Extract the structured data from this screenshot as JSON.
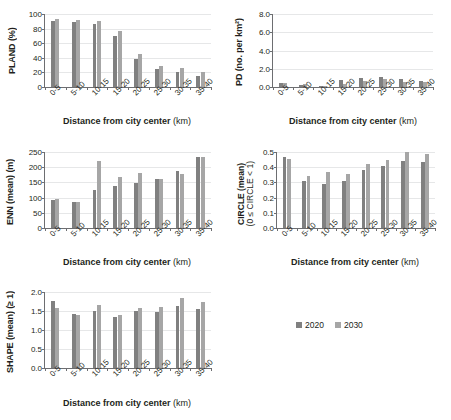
{
  "figure": {
    "legend": {
      "position": "center-right",
      "entries": [
        {
          "label": "2020",
          "color": "#808080"
        },
        {
          "label": "2030",
          "color": "#a6a6a6"
        }
      ]
    },
    "shared_xlabel": "Distance from city center",
    "shared_xunit": "(km)",
    "categories": [
      "0-5",
      "5-10",
      "10-15",
      "15-20",
      "20-25",
      "25-30",
      "30-35",
      "35-40"
    ]
  },
  "chart_data": [
    {
      "id": "pland",
      "type": "bar",
      "title": "",
      "xlabel": "Distance from city center (km)",
      "ylabel": "PLAND (%)",
      "ylabel_main": "PLAND",
      "ylabel_unit": "(%)",
      "categories": [
        "0-5",
        "5-10",
        "10-15",
        "15-20",
        "20-25",
        "25-30",
        "30-35",
        "35-40"
      ],
      "series": [
        {
          "name": "2020",
          "color": "#808080",
          "values": [
            91,
            88.5,
            86.5,
            69.5,
            38,
            24,
            20.5,
            15.5
          ]
        },
        {
          "name": "2030",
          "color": "#a6a6a6",
          "values": [
            93.5,
            91.5,
            90.5,
            76.5,
            45,
            29,
            26,
            20.5
          ]
        }
      ],
      "ylim": [
        0,
        100
      ],
      "yticks": [
        0,
        20,
        40,
        60,
        80,
        100
      ],
      "ytick_labels": [
        "0",
        "20",
        "40",
        "60",
        "80",
        "100"
      ],
      "grid": true
    },
    {
      "id": "pd",
      "type": "bar",
      "title": "",
      "xlabel": "Distance from city center (km)",
      "ylabel": "PD (no. per km²)",
      "ylabel_main": "PD",
      "ylabel_unit": "(no. per km²)",
      "categories": [
        "0-5",
        "5-10",
        "10-15",
        "15-20",
        "20-25",
        "25-30",
        "30-35",
        "35-40"
      ],
      "series": [
        {
          "name": "2020",
          "color": "#808080",
          "values": [
            0.4,
            0.2,
            0.1,
            0.75,
            1.0,
            1.05,
            0.85,
            0.65
          ]
        },
        {
          "name": "2030",
          "color": "#a6a6a6",
          "values": [
            0.4,
            0.3,
            0.1,
            0.3,
            0.7,
            0.85,
            0.6,
            0.5
          ]
        }
      ],
      "ylim": [
        0,
        8
      ],
      "yticks": [
        0,
        2,
        4,
        6,
        8
      ],
      "ytick_labels": [
        "0.0",
        "2.0",
        "4.0",
        "6.0",
        "8.0"
      ],
      "grid": true
    },
    {
      "id": "enn",
      "type": "bar",
      "title": "",
      "xlabel": "Distance from city center (km)",
      "ylabel": "ENN (mean) (m)",
      "ylabel_main": "ENN",
      "ylabel_unit": "(mean) (m)",
      "categories": [
        "0-5",
        "5-10",
        "10-15",
        "15-20",
        "20-25",
        "25-30",
        "30-35",
        "35-40"
      ],
      "series": [
        {
          "name": "2020",
          "color": "#808080",
          "values": [
            91,
            85,
            125,
            138,
            149,
            160,
            188,
            233
          ]
        },
        {
          "name": "2030",
          "color": "#a6a6a6",
          "values": [
            94,
            85,
            222,
            167,
            180,
            162,
            178,
            233
          ]
        }
      ],
      "ylim": [
        0,
        250
      ],
      "yticks": [
        0,
        50,
        100,
        150,
        200,
        250
      ],
      "ytick_labels": [
        "0",
        "50",
        "100",
        "150",
        "200",
        "250"
      ],
      "grid": true
    },
    {
      "id": "circle",
      "type": "bar",
      "title": "",
      "xlabel": "Distance from city center (km)",
      "ylabel": "CIRCLE (mean) (0 ≤ CIRCLE < 1)",
      "ylabel_main": "CIRCLE (mean)",
      "ylabel_unit": "(0 ≤ CIRCLE < 1)",
      "categories": [
        "0-5",
        "5-10",
        "10-15",
        "15-20",
        "20-25",
        "25-30",
        "30-35",
        "35-40"
      ],
      "series": [
        {
          "name": "2020",
          "color": "#808080",
          "values": [
            0.47,
            0.31,
            0.29,
            0.31,
            0.38,
            0.41,
            0.44,
            0.435
          ]
        },
        {
          "name": "2030",
          "color": "#a6a6a6",
          "values": [
            0.455,
            0.34,
            0.37,
            0.355,
            0.42,
            0.45,
            0.5,
            0.49
          ]
        }
      ],
      "ylim": [
        0,
        0.5
      ],
      "yticks": [
        0,
        0.1,
        0.2,
        0.3,
        0.4,
        0.5
      ],
      "ytick_labels": [
        "0.0",
        "0.1",
        "0.2",
        "0.3",
        "0.4",
        "0.5"
      ],
      "grid": true
    },
    {
      "id": "shape",
      "type": "bar",
      "title": "",
      "xlabel": "Distance from city center (km)",
      "ylabel": "SHAPE (mean) (≥ 1)",
      "ylabel_main": "SHAPE",
      "ylabel_unit": "(mean) (≥ 1)",
      "categories": [
        "0-5",
        "5-10",
        "10-15",
        "15-20",
        "20-25",
        "25-30",
        "30-35",
        "35-40"
      ],
      "series": [
        {
          "name": "2020",
          "color": "#808080",
          "values": [
            1.77,
            1.42,
            1.5,
            1.33,
            1.49,
            1.47,
            1.64,
            1.56
          ]
        },
        {
          "name": "2030",
          "color": "#a6a6a6",
          "values": [
            1.57,
            1.39,
            1.67,
            1.4,
            1.58,
            1.6,
            1.85,
            1.73
          ]
        }
      ],
      "ylim": [
        0,
        2
      ],
      "yticks": [
        0,
        0.5,
        1.0,
        1.5,
        2.0
      ],
      "ytick_labels": [
        "0.0",
        "0.5",
        "1.0",
        "1.5",
        "2.0"
      ],
      "grid": true
    }
  ]
}
